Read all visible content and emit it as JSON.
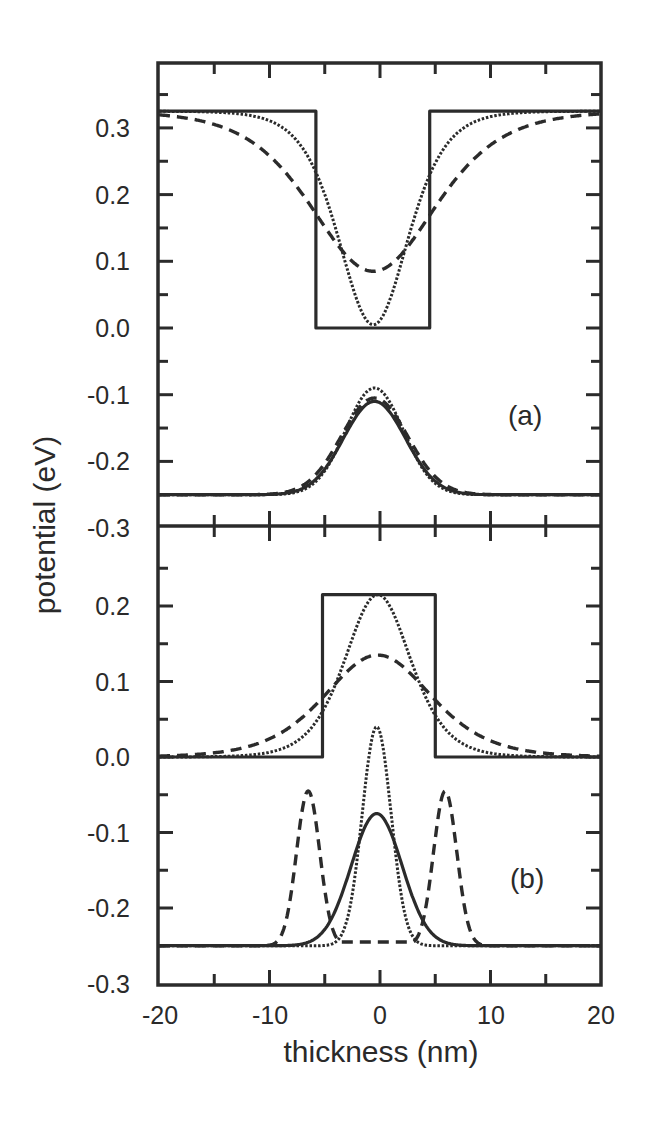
{
  "chart_data": {
    "type": "line",
    "xlabel": "thickness (nm)",
    "ylabel": "potential (eV)",
    "xlim": [
      -20,
      20
    ],
    "x_ticks": [
      -20,
      -10,
      0,
      10,
      20
    ],
    "x_minor_step": 5,
    "grid": false,
    "legend": "none",
    "panels": [
      {
        "label": "(a)",
        "ylim": [
          -0.3,
          0.4
        ],
        "y_ticks": [
          "0.3",
          "0.2",
          "0.1",
          "0.0",
          "-0.1",
          "-0.2",
          "-0.3"
        ],
        "y_tick_values": [
          0.3,
          0.2,
          0.1,
          0.0,
          -0.1,
          -0.2,
          -0.3
        ],
        "series": [
          {
            "name": "abrupt well potential",
            "style": "solid",
            "x": [
              -20,
              -5.8,
              -5.8,
              4.5,
              4.5,
              20
            ],
            "y": [
              0.325,
              0.325,
              0.0,
              0.0,
              0.325,
              0.325
            ]
          },
          {
            "name": "dotted interdiffused well (short)",
            "style": "dotted",
            "shape": "cosh_well",
            "center": -0.6,
            "depth": 0.325,
            "width_nm": 4.2,
            "min": 0.005
          },
          {
            "name": "dashed interdiffused well (long)",
            "style": "dashed",
            "shape": "cosh_well",
            "center": -0.6,
            "depth": 0.325,
            "width_nm": 7.5,
            "min": 0.085
          },
          {
            "name": "abrupt ground state wavefunction",
            "style": "solid",
            "shape": "gaussian",
            "center": -0.5,
            "base": -0.25,
            "peak": -0.11,
            "sigma": 2.8
          },
          {
            "name": "dotted ground state wavefunction",
            "style": "dotted",
            "shape": "gaussian",
            "center": -0.5,
            "base": -0.25,
            "peak": -0.09,
            "sigma": 2.6
          },
          {
            "name": "dashed ground state wavefunction",
            "style": "dashed",
            "shape": "gaussian",
            "center": -0.5,
            "base": -0.25,
            "peak": -0.105,
            "sigma": 3.0
          }
        ]
      },
      {
        "label": "(b)",
        "ylim": [
          -0.3,
          0.3
        ],
        "y_ticks": [
          "0.2",
          "0.1",
          "0.0",
          "-0.1",
          "-0.2",
          "-0.3"
        ],
        "y_tick_values": [
          0.2,
          0.1,
          0.0,
          -0.1,
          -0.2,
          -0.3
        ],
        "series": [
          {
            "name": "abrupt barrier potential",
            "style": "solid",
            "x": [
              -20,
              -5.2,
              -5.2,
              5.0,
              5.0,
              20
            ],
            "y": [
              0.0,
              0.0,
              0.215,
              0.215,
              0.0,
              0.0
            ]
          },
          {
            "name": "dotted interdiffused barrier (short)",
            "style": "dotted",
            "shape": "cosh_bump",
            "center": -0.2,
            "height": 0.215,
            "width_nm": 4.0
          },
          {
            "name": "dashed interdiffused barrier (long)",
            "style": "dashed",
            "shape": "cosh_bump",
            "center": -0.2,
            "height": 0.135,
            "width_nm": 6.5
          },
          {
            "name": "abrupt ground state wavefunction",
            "style": "solid",
            "shape": "gaussian",
            "center": -0.3,
            "base": -0.25,
            "peak": -0.075,
            "sigma": 2.3
          },
          {
            "name": "dotted ground state wavefunction",
            "style": "dotted",
            "shape": "gaussian",
            "center": -0.3,
            "base": -0.25,
            "peak": 0.04,
            "sigma": 1.3
          },
          {
            "name": "dashed ground state wavefunction (split)",
            "style": "dashed",
            "shape": "double_gaussian",
            "centers": [
              -6.5,
              5.9
            ],
            "base": -0.25,
            "peak": -0.045,
            "sigma": 1.05,
            "mid_floor": -0.245
          }
        ]
      }
    ]
  },
  "axes": {
    "x_tick_labels": [
      "-20",
      "-10",
      "0",
      "10",
      "20"
    ],
    "xlabel": "thickness (nm)",
    "ylabel": "potential (eV)"
  },
  "panels": {
    "a": {
      "label": "(a)"
    },
    "b": {
      "label": "(b)"
    }
  }
}
